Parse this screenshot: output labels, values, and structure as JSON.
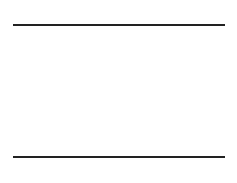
{
  "top_sequence": {
    "labels": [
      "0",
      "1",
      "6",
      "1",
      "2",
      "3",
      "5"
    ],
    "positions_x": [
      37,
      65,
      94,
      122,
      151,
      180,
      205
    ]
  },
  "bottom_sequence": {
    "labels": [
      "6",
      "3",
      "5",
      "4",
      "0",
      "2",
      "4"
    ],
    "positions_x": [
      37,
      65,
      94,
      122,
      151,
      180,
      205
    ]
  },
  "intervals": [
    {
      "label": "6",
      "x1": 38,
      "x2": 94,
      "y": 43
    },
    {
      "label": "1",
      "x1": 66,
      "x2": 121,
      "y": 62
    },
    {
      "label": "3",
      "x1": 66,
      "x2": 181,
      "y": 81
    },
    {
      "label": "5",
      "x1": 95,
      "x2": 205,
      "y": 100
    },
    {
      "label": "4",
      "x1": 121,
      "x2": 204,
      "y": 119
    },
    {
      "label": "2",
      "x1": 151,
      "x2": 180,
      "y": 138
    }
  ],
  "colors": {
    "line": "#222222",
    "bar": "#111111",
    "text": "#333333"
  }
}
